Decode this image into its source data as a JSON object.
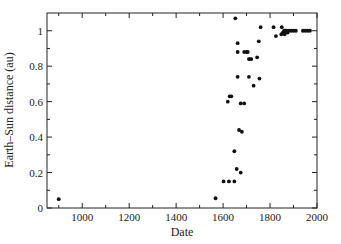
{
  "chart_data": {
    "type": "scatter",
    "title": "",
    "xlabel": "Date",
    "ylabel": "Earth–Sun distance (au)",
    "xlim": [
      850,
      2000
    ],
    "ylim": [
      0,
      1.1
    ],
    "xticks": [
      1000,
      1200,
      1400,
      1600,
      1800,
      2000
    ],
    "yticks": [
      0,
      0.2,
      0.4,
      0.6,
      0.8,
      1
    ],
    "ytick_labels": [
      "0",
      "0.2",
      "0.4",
      "0.6",
      "0.8",
      "1"
    ],
    "grid": false,
    "legend": null,
    "series": [
      {
        "name": "estimates",
        "points": [
          [
            900,
            0.05
          ],
          [
            1568,
            0.055
          ],
          [
            1602,
            0.15
          ],
          [
            1625,
            0.15
          ],
          [
            1648,
            0.15
          ],
          [
            1620,
            0.6
          ],
          [
            1628,
            0.63
          ],
          [
            1635,
            0.63
          ],
          [
            1648,
            0.32
          ],
          [
            1658,
            0.22
          ],
          [
            1675,
            0.2
          ],
          [
            1652,
            1.07
          ],
          [
            1662,
            0.93
          ],
          [
            1662,
            0.88
          ],
          [
            1662,
            0.74
          ],
          [
            1668,
            0.44
          ],
          [
            1680,
            0.43
          ],
          [
            1675,
            0.59
          ],
          [
            1690,
            0.59
          ],
          [
            1690,
            0.88
          ],
          [
            1700,
            0.88
          ],
          [
            1705,
            0.88
          ],
          [
            1710,
            0.84
          ],
          [
            1715,
            0.84
          ],
          [
            1720,
            0.84
          ],
          [
            1710,
            0.74
          ],
          [
            1730,
            0.69
          ],
          [
            1745,
            0.85
          ],
          [
            1752,
            0.94
          ],
          [
            1755,
            0.73
          ],
          [
            1760,
            1.02
          ],
          [
            1815,
            1.02
          ],
          [
            1825,
            0.97
          ],
          [
            1850,
            1.02
          ],
          [
            1848,
            0.98
          ],
          [
            1855,
            0.99
          ],
          [
            1860,
            1.0
          ],
          [
            1862,
            0.98
          ],
          [
            1865,
            1.0
          ],
          [
            1870,
            1.0
          ],
          [
            1875,
            0.99
          ],
          [
            1880,
            1.0
          ],
          [
            1890,
            1.0
          ],
          [
            1900,
            1.0
          ],
          [
            1910,
            1.0
          ],
          [
            1940,
            1.0
          ],
          [
            1950,
            1.0
          ],
          [
            1960,
            1.0
          ],
          [
            1970,
            1.0
          ]
        ]
      }
    ]
  }
}
